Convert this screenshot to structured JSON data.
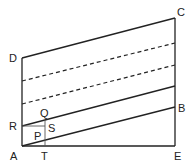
{
  "diagram": {
    "stroke_color": "#222222",
    "thin_color": "#555555",
    "points": {
      "A": {
        "x": 22,
        "y": 146,
        "label": "A"
      },
      "E": {
        "x": 175,
        "y": 146,
        "label": "E"
      },
      "D": {
        "x": 22,
        "y": 58,
        "label": "D"
      },
      "C": {
        "x": 175,
        "y": 18,
        "label": "C"
      },
      "B": {
        "x": 175,
        "y": 107,
        "label": "B"
      },
      "R": {
        "x": 22,
        "y": 126,
        "label": "R"
      },
      "T": {
        "x": 45,
        "y": 146,
        "label": "T"
      },
      "Q": {
        "x": 45,
        "y": 120,
        "label": "Q"
      },
      "S": {
        "x": 45,
        "y": 126,
        "label": "S"
      },
      "P": {
        "x": 38,
        "y": 133,
        "label": "P"
      }
    },
    "labels": {
      "A": "A",
      "E": "E",
      "D": "D",
      "C": "C",
      "B": "B",
      "R": "R",
      "T": "T",
      "Q": "Q",
      "S": "S",
      "P": "P"
    }
  }
}
